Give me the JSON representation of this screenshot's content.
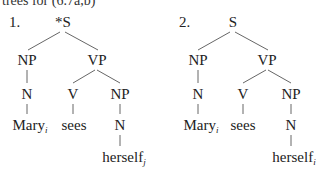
{
  "caption": "trees for (6.7a,b)",
  "trees": [
    {
      "number": "1.",
      "root": "*S",
      "np": "NP",
      "vp": "VP",
      "n1": "N",
      "v": "V",
      "np2": "NP",
      "subject": "Mary",
      "subject_index": "i",
      "verb": "sees",
      "n2": "N",
      "object": "herself",
      "object_index": "j"
    },
    {
      "number": "2.",
      "root": "S",
      "np": "NP",
      "vp": "VP",
      "n1": "N",
      "v": "V",
      "np2": "NP",
      "subject": "Mary",
      "subject_index": "i",
      "verb": "sees",
      "n2": "N",
      "object": "herself",
      "object_index": "i"
    }
  ]
}
